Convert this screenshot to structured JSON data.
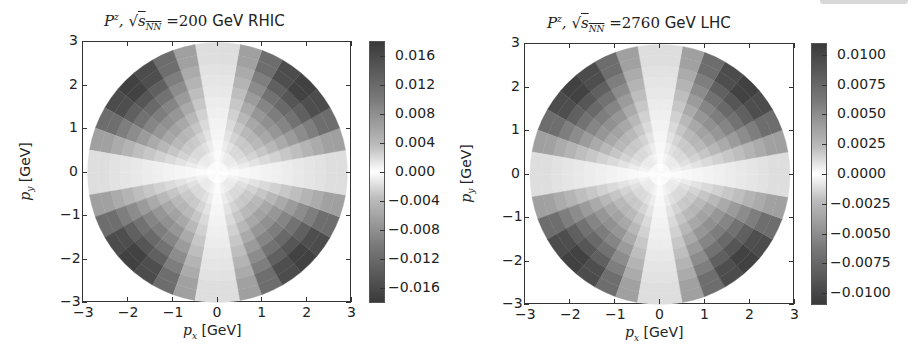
{
  "chart_data": [
    {
      "type": "heatmap",
      "projection": "polar-sector heatmap on Cartesian axes",
      "title": "P^z, √s_NN = 200 GeV RHIC",
      "title_parts": {
        "var": "P",
        "sup": "z",
        "sqrt": "s",
        "sub": "NN",
        "value": "= 200",
        "unit": "GeV RHIC"
      },
      "xlabel": "p_x [GeV]",
      "ylabel": "p_y [GeV]",
      "xlim": [
        -3,
        3
      ],
      "ylim": [
        -3,
        3
      ],
      "xticks": [
        "−3",
        "−2",
        "−1",
        "0",
        "1",
        "2",
        "3"
      ],
      "yticks": [
        "3",
        "2",
        "1",
        "0",
        "−1",
        "−2",
        "−3"
      ],
      "colorbar": {
        "range": [
          -0.018,
          0.018
        ],
        "ticks": [
          "0.016",
          "0.012",
          "0.008",
          "0.004",
          "0.000",
          "−0.004",
          "−0.008",
          "−0.012",
          "−0.016"
        ],
        "tick_values": [
          0.016,
          0.012,
          0.008,
          0.004,
          0.0,
          -0.004,
          -0.008,
          -0.012,
          -0.016
        ],
        "colormap": "grayscale diverging (white at 0, dark at ±max)"
      },
      "pattern": "quadrupole ~ sin(2φ): positive in quadrants I & III, negative in II & IV; ~0 along p_x and p_y axes; magnitude grows with p_T up to ~0.016 at p_T≈2.5–3 GeV",
      "max_abs": 0.017,
      "radius_max": 3.0
    },
    {
      "type": "heatmap",
      "projection": "polar-sector heatmap on Cartesian axes",
      "title": "P^z, √s_NN = 2760 GeV LHC",
      "title_parts": {
        "var": "P",
        "sup": "z",
        "sqrt": "s",
        "sub": "NN",
        "value": "= 2760",
        "unit": "GeV LHC"
      },
      "xlabel": "p_x [GeV]",
      "ylabel": "p_y [GeV]",
      "xlim": [
        -3,
        3
      ],
      "ylim": [
        -3,
        3
      ],
      "xticks": [
        "−3",
        "−2",
        "−1",
        "0",
        "1",
        "2",
        "3"
      ],
      "yticks": [
        "3",
        "2",
        "1",
        "0",
        "−1",
        "−2",
        "−3"
      ],
      "colorbar": {
        "range": [
          -0.011,
          0.011
        ],
        "ticks": [
          "0.0100",
          "0.0075",
          "0.0050",
          "0.0025",
          "0.0000",
          "−0.0025",
          "−0.0050",
          "−0.0075",
          "−0.0100"
        ],
        "tick_values": [
          0.01,
          0.0075,
          0.005,
          0.0025,
          0.0,
          -0.0025,
          -0.005,
          -0.0075,
          -0.01
        ],
        "colormap": "grayscale diverging (white at 0, dark at ±max)"
      },
      "pattern": "quadrupole ~ sin(2φ): same structure as RHIC, magnitude up to ~0.010 at p_T≈2.5–3 GeV",
      "max_abs": 0.0105,
      "radius_max": 3.0
    }
  ],
  "panels": [
    {
      "title_var": "P",
      "title_sup": "z",
      "title_sqrt_arg": "s",
      "title_sub": "NN",
      "title_eq": "=",
      "title_value": "200",
      "title_unit": "GeV RHIC",
      "xlabel_var": "p",
      "xlabel_sub": "x",
      "xlabel_unit": "[GeV]",
      "ylabel_var": "p",
      "ylabel_sub": "y",
      "ylabel_unit": "[GeV]",
      "xticks": [
        "−3",
        "−2",
        "−1",
        "0",
        "1",
        "2",
        "3"
      ],
      "yticks": [
        "3",
        "2",
        "1",
        "0",
        "−1",
        "−2",
        "−3"
      ],
      "cbar_ticks": [
        "0.016",
        "0.012",
        "0.008",
        "0.004",
        "0.000",
        "−0.004",
        "−0.008",
        "−0.012",
        "−0.016"
      ]
    },
    {
      "title_var": "P",
      "title_sup": "z",
      "title_sqrt_arg": "s",
      "title_sub": "NN",
      "title_eq": "=",
      "title_value": "2760",
      "title_unit": "GeV LHC",
      "xlabel_var": "p",
      "xlabel_sub": "x",
      "xlabel_unit": "[GeV]",
      "ylabel_var": "p",
      "ylabel_sub": "y",
      "ylabel_unit": "[GeV]",
      "xticks": [
        "−3",
        "−2",
        "−1",
        "0",
        "1",
        "2",
        "3"
      ],
      "yticks": [
        "3",
        "2",
        "1",
        "0",
        "−1",
        "−2",
        "−3"
      ],
      "cbar_ticks": [
        "0.0100",
        "0.0075",
        "0.0050",
        "0.0025",
        "0.0000",
        "−0.0025",
        "−0.0050",
        "−0.0075",
        "−0.0100"
      ]
    }
  ]
}
